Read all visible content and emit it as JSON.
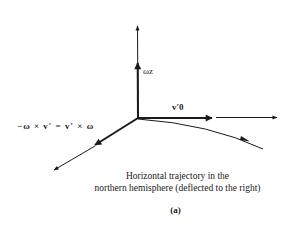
{
  "diagram": {
    "labels": {
      "omega_z": "ωz",
      "v0_prime": "v′0",
      "equation": "−ω × v′ = v′ × ω"
    },
    "caption": {
      "line1": "Horizontal trajectory in the",
      "line2": "northern hemisphere (deflected to the right)"
    },
    "figure_label": "(a)",
    "colors": {
      "ink": "#1a1a1a",
      "background": "#ffffff"
    }
  }
}
